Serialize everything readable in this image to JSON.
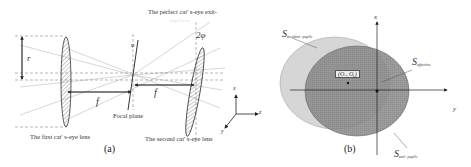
{
  "figure_a": {
    "caption": "(a)",
    "labels": {
      "perfect_exit": "The perfect cat' s-eye exit-",
      "perfect_exit_faded": "pupil lens",
      "two_phi": "2φ",
      "phi": "φ",
      "r": "r",
      "f_left": "f",
      "f_right": "f",
      "focal_plane": "Focal plane",
      "first_lens": "The first cat' s-eye lens",
      "second_lens": "The second cat' s-eye lens"
    },
    "axes": {
      "x": "x",
      "y": "y",
      "z": "z"
    }
  },
  "figure_b": {
    "caption": "(b)",
    "axes": {
      "x": "x",
      "y": "y"
    },
    "labels": {
      "s_incident": {
        "main": "S",
        "sub": "incident−pupils"
      },
      "s_effective": {
        "main": "S",
        "sub": "effective"
      },
      "s_exit": {
        "main": "S",
        "sub": "exit−pupils"
      },
      "offset_point": "(Oₓ, Oᵧ)"
    },
    "colors": {
      "incident": "#d6d6d6",
      "exit": "#8e8e8e",
      "overlap": "#7a7a7a"
    }
  }
}
